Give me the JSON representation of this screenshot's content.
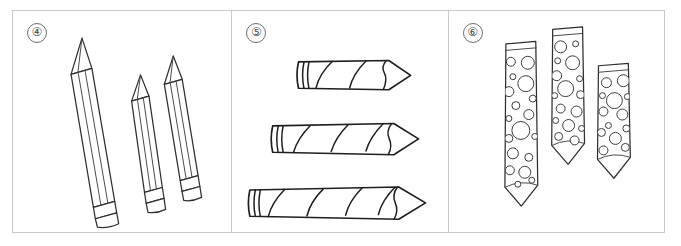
{
  "figure": {
    "background_color": "#ffffff",
    "border_color": "#c9c9c9",
    "ink_color": "#2f2f2f",
    "panel_count": 3
  },
  "panels": [
    {
      "index_label": "4",
      "index_glyph": "④",
      "name": "plain-pencils-panel",
      "description": "Three tilted plain pencils with sharpened tips and ferrule bands",
      "object_type": "pencil",
      "style": "plain",
      "orientation": "tilted",
      "item_count": 3,
      "items": [
        {
          "name": "long-pencil",
          "size": "long",
          "length_rank": 1
        },
        {
          "name": "short-pencil",
          "size": "short",
          "length_rank": 3
        },
        {
          "name": "medium-pencil",
          "size": "medium",
          "length_rank": 2
        }
      ]
    },
    {
      "index_label": "5",
      "index_glyph": "⑤",
      "name": "striped-crayons-panel",
      "description": "Three horizontal crayons with spiral diagonal stripe wrappers, increasing in length",
      "object_type": "crayon",
      "style": "spiral-striped",
      "orientation": "horizontal",
      "item_count": 3,
      "items": [
        {
          "name": "short-crayon",
          "size": "short",
          "length_rank": 3,
          "stripe_count": 2
        },
        {
          "name": "medium-crayon",
          "size": "medium",
          "length_rank": 2,
          "stripe_count": 3
        },
        {
          "name": "long-crayon",
          "size": "long",
          "length_rank": 1,
          "stripe_count": 4
        }
      ]
    },
    {
      "index_label": "6",
      "index_glyph": "⑥",
      "name": "dotted-pencils-panel",
      "description": "Three vertical pencils decorated with bubble or polka-dot patterns",
      "object_type": "pencil",
      "style": "polka-dot",
      "orientation": "vertical",
      "item_count": 3,
      "items": [
        {
          "name": "long-dotted-pencil",
          "size": "long",
          "length_rank": 1
        },
        {
          "name": "medium-dotted-pencil",
          "size": "medium",
          "length_rank": 2
        },
        {
          "name": "short-dotted-pencil",
          "size": "short",
          "length_rank": 3
        }
      ]
    }
  ]
}
